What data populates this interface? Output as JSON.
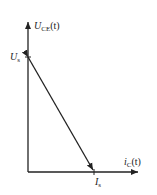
{
  "diagram": {
    "y_axis": {
      "symbol": "U",
      "subscript": "CE",
      "suffix": "(t)"
    },
    "x_axis": {
      "symbol": "i",
      "subscript": "C",
      "suffix": "(t)"
    },
    "y_intercept": {
      "symbol": "U",
      "subscript": "s"
    },
    "x_intercept": {
      "symbol": "I",
      "subscript": "s"
    },
    "line_color": "#222222"
  }
}
